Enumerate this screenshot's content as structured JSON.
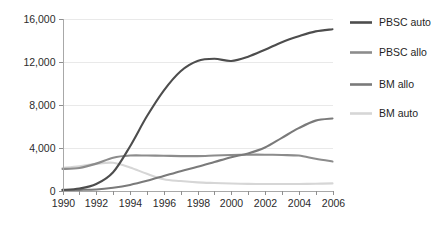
{
  "chart_data": {
    "type": "line",
    "title": "",
    "xlabel": "",
    "ylabel": "",
    "xlim": [
      1990,
      2006
    ],
    "ylim": [
      0,
      16000
    ],
    "grid": true,
    "legend_position": "right",
    "x": [
      1990,
      1991,
      1992,
      1993,
      1994,
      1995,
      1996,
      1997,
      1998,
      1999,
      2000,
      2001,
      2002,
      2003,
      2004,
      2005,
      2006
    ],
    "y_ticks": [
      0,
      4000,
      8000,
      12000,
      16000
    ],
    "y_tick_labels": [
      "0",
      "4,000",
      "8,000",
      "12,000",
      "16,000"
    ],
    "x_ticks": [
      1990,
      1991,
      1992,
      1993,
      1994,
      1995,
      1996,
      1997,
      1998,
      1999,
      2000,
      2001,
      2002,
      2003,
      2004,
      2005,
      2006
    ],
    "x_tick_labels": [
      "1990",
      "",
      "1992",
      "",
      "1994",
      "",
      "1996",
      "",
      "1998",
      "",
      "2000",
      "",
      "2002",
      "",
      "2004",
      "",
      "2006"
    ],
    "series": [
      {
        "name": "PBSC auto",
        "color": "#4d4d4d",
        "values": [
          60,
          180,
          600,
          1700,
          4100,
          6900,
          9300,
          11100,
          12050,
          12250,
          12050,
          12450,
          13100,
          13800,
          14350,
          14800,
          15000
        ]
      },
      {
        "name": "PBSC allo",
        "color": "#8c8c8c",
        "values": [
          2000,
          2100,
          2500,
          3050,
          3250,
          3250,
          3230,
          3200,
          3200,
          3250,
          3300,
          3330,
          3330,
          3300,
          3250,
          2950,
          2700
        ]
      },
      {
        "name": "BM allo",
        "color": "#7a7a7a",
        "values": [
          40,
          60,
          100,
          260,
          520,
          900,
          1350,
          1800,
          2200,
          2650,
          3100,
          3450,
          4000,
          4900,
          5800,
          6500,
          6700
        ]
      },
      {
        "name": "BM auto",
        "color": "#d6d6d6",
        "values": [
          2100,
          2250,
          2480,
          2580,
          2150,
          1550,
          1050,
          880,
          760,
          700,
          650,
          620,
          600,
          600,
          610,
          630,
          660
        ]
      }
    ]
  },
  "legend": {
    "entries": [
      {
        "label": "PBSC auto",
        "color": "#4d4d4d"
      },
      {
        "label": "PBSC allo",
        "color": "#8c8c8c"
      },
      {
        "label": "BM allo",
        "color": "#7a7a7a"
      },
      {
        "label": "BM auto",
        "color": "#d6d6d6"
      }
    ]
  },
  "caption": {
    "text": ""
  }
}
